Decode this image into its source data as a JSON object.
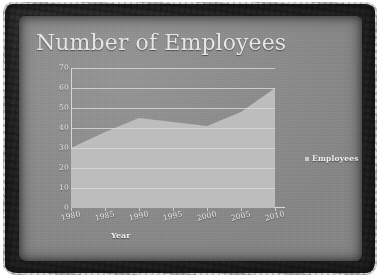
{
  "slide": {
    "title": "Number of Employees",
    "background_color": "#8c8c8c",
    "border_color": "#2f2f2f",
    "title_color": "#e6e6e6"
  },
  "legend": {
    "marker_icon": "square-marker-icon",
    "label": "Employees",
    "marker_color": "#c9c9c9",
    "position": "right"
  },
  "chart_data": {
    "type": "area",
    "title": "Number of Employees",
    "xlabel": "Year",
    "ylabel": "",
    "categories": [
      "1980",
      "1985",
      "1990",
      "1995",
      "2000",
      "2005",
      "2010"
    ],
    "values": [
      30,
      38,
      45,
      43,
      41,
      48,
      60
    ],
    "series": [
      {
        "name": "Employees",
        "values": [
          30,
          38,
          45,
          43,
          41,
          48,
          60
        ]
      }
    ],
    "ylim": [
      0,
      70
    ],
    "yticks": [
      "0",
      "10",
      "20",
      "30",
      "40",
      "50",
      "60",
      "70"
    ],
    "xticks": [
      "1980",
      "1985",
      "1990",
      "1995",
      "2000",
      "2005",
      "2010"
    ],
    "grid": true,
    "grid_color": "#d8d8d8",
    "area_color": "#bdbdbd",
    "legend_position": "right"
  }
}
